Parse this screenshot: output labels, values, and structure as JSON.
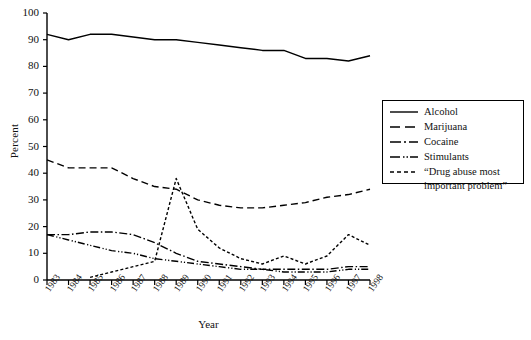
{
  "chart_data": {
    "type": "line",
    "title": "",
    "xlabel": "Year",
    "ylabel": "Percent",
    "ylim": [
      0,
      100
    ],
    "ytick_labels": [
      "0",
      "10",
      "20",
      "30",
      "40",
      "50",
      "60",
      "70",
      "80",
      "90",
      "100"
    ],
    "ytick_values": [
      0,
      10,
      20,
      30,
      40,
      50,
      60,
      70,
      80,
      90,
      100
    ],
    "grid": false,
    "legend_position": "right",
    "categories": [
      "1983",
      "1984",
      "1985",
      "1986",
      "1987",
      "1988",
      "1989",
      "1990",
      "1991",
      "1992",
      "1993",
      "1994",
      "1995",
      "1996",
      "1997",
      "1998"
    ],
    "x": [
      1983,
      1984,
      1985,
      1986,
      1987,
      1988,
      1989,
      1990,
      1991,
      1992,
      1993,
      1994,
      1995,
      1996,
      1997,
      1998
    ],
    "series": [
      {
        "name": "Alcohol",
        "style": "solid",
        "values": [
          92,
          90,
          92,
          92,
          91,
          90,
          90,
          89,
          88,
          87,
          86,
          86,
          83,
          83,
          82,
          84
        ]
      },
      {
        "name": "Marijuana",
        "style": "dashed",
        "values": [
          45,
          42,
          42,
          42,
          38,
          35,
          34,
          30,
          28,
          27,
          27,
          28,
          29,
          31,
          32,
          34
        ]
      },
      {
        "name": "Cocaine",
        "style": "dash-dot",
        "values": [
          17,
          17,
          18,
          18,
          17,
          14,
          10,
          7,
          6,
          5,
          4,
          4,
          4,
          4,
          5,
          5
        ]
      },
      {
        "name": "Stimulants",
        "style": "dash-dot-dot",
        "values": [
          17,
          15,
          13,
          11,
          10,
          8,
          7,
          6,
          5,
          4,
          4,
          3,
          3,
          3,
          4,
          4
        ]
      },
      {
        "name": "“Drug abuse most important problem”",
        "style": "fine-dashed",
        "values": [
          null,
          null,
          1,
          3,
          5,
          7,
          38,
          19,
          12,
          8,
          6,
          9,
          6,
          9,
          17,
          13
        ]
      }
    ]
  },
  "legend": {
    "entries": [
      {
        "label": "Alcohol"
      },
      {
        "label": "Marijuana"
      },
      {
        "label": "Cocaine"
      },
      {
        "label": "Stimulants"
      },
      {
        "label_line1": "“Drug abuse most",
        "label_line2": "important problem”"
      }
    ]
  },
  "axes": {
    "ylabel": "Percent",
    "xlabel": "Year"
  },
  "colors": {
    "line": "#000000",
    "background": "#ffffff",
    "axis": "#000000"
  }
}
